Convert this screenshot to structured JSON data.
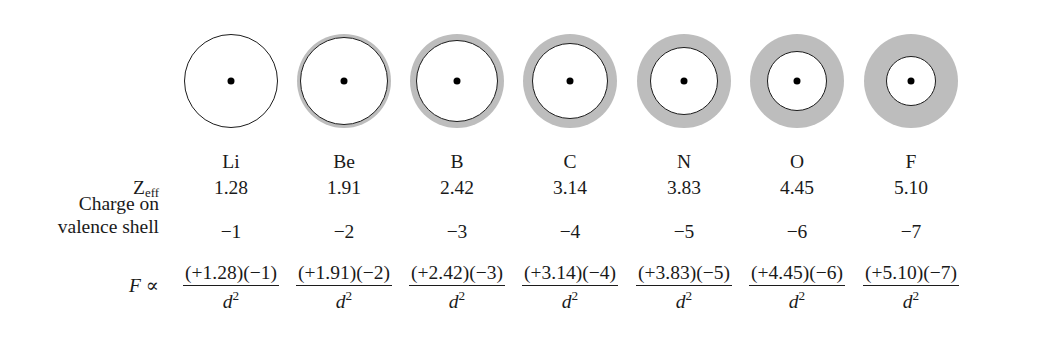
{
  "row_labels": {
    "zeff": "Z",
    "zeff_sub": "eff",
    "charge_line1": "Charge on",
    "charge_line2": "valence shell",
    "force_symbol": "F",
    "force_prop": "∝"
  },
  "denominator": "d",
  "denominator_exp": "2",
  "colors": {
    "shell_gray": "#bdbdbd",
    "outline": "#1c1c1c",
    "nucleus": "#000000",
    "background": "#ffffff",
    "text": "#1a1a1a"
  },
  "elements": [
    {
      "symbol": "Li",
      "zeff": "1.28",
      "charge": "−1",
      "numerator": "(+1.28)(−1)",
      "center_x": 231,
      "outer_radius": 47,
      "core_radius": 47,
      "shaded": false
    },
    {
      "symbol": "Be",
      "zeff": "1.91",
      "charge": "−2",
      "numerator": "(+1.91)(−2)",
      "center_x": 344,
      "outer_radius": 47,
      "core_radius": 44,
      "shaded": true
    },
    {
      "symbol": "B",
      "zeff": "2.42",
      "charge": "−3",
      "numerator": "(+2.42)(−3)",
      "center_x": 457,
      "outer_radius": 47,
      "core_radius": 41,
      "shaded": true
    },
    {
      "symbol": "C",
      "zeff": "3.14",
      "charge": "−4",
      "numerator": "(+3.14)(−4)",
      "center_x": 570,
      "outer_radius": 47,
      "core_radius": 38,
      "shaded": true
    },
    {
      "symbol": "N",
      "zeff": "3.83",
      "charge": "−5",
      "numerator": "(+3.83)(−5)",
      "center_x": 684,
      "outer_radius": 47,
      "core_radius": 34,
      "shaded": true
    },
    {
      "symbol": "O",
      "zeff": "4.45",
      "charge": "−6",
      "numerator": "(+4.45)(−6)",
      "center_x": 797,
      "outer_radius": 47,
      "core_radius": 30,
      "shaded": true
    },
    {
      "symbol": "F",
      "zeff": "5.10",
      "charge": "−7",
      "numerator": "(+5.10)(−7)",
      "center_x": 911,
      "outer_radius": 47,
      "core_radius": 25,
      "shaded": true
    }
  ],
  "chart_data": {
    "type": "table",
    "categories": [
      "Li",
      "Be",
      "B",
      "C",
      "N",
      "O",
      "F"
    ],
    "series": [
      {
        "name": "Zeff",
        "values": [
          1.28,
          1.91,
          2.42,
          3.14,
          3.83,
          4.45,
          5.1
        ]
      },
      {
        "name": "Charge on valence shell",
        "values": [
          -1,
          -2,
          -3,
          -4,
          -5,
          -6,
          -7
        ]
      }
    ],
    "annotations": [
      "F ∝ (+1.28)(−1)/d²",
      "F ∝ (+1.91)(−2)/d²",
      "F ∝ (+2.42)(−3)/d²",
      "F ∝ (+3.14)(−4)/d²",
      "F ∝ (+3.83)(−5)/d²",
      "F ∝ (+4.45)(−6)/d²",
      "F ∝ (+5.10)(−7)/d²"
    ],
    "xlabel": "",
    "ylabel": "",
    "grid": false,
    "legend": "none"
  }
}
